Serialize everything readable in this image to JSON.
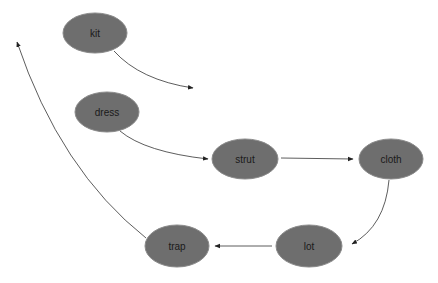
{
  "diagram": {
    "type": "directed-graph",
    "node_color": "#6e6e6e",
    "edge_color": "#333333",
    "nodes": [
      {
        "id": "kit",
        "label": "kit",
        "cx": 95,
        "cy": 33
      },
      {
        "id": "dress",
        "label": "dress",
        "cx": 107,
        "cy": 112
      },
      {
        "id": "strut",
        "label": "strut",
        "cx": 245,
        "cy": 159
      },
      {
        "id": "cloth",
        "label": "cloth",
        "cx": 391,
        "cy": 159
      },
      {
        "id": "lot",
        "label": "lot",
        "cx": 309,
        "cy": 246
      },
      {
        "id": "trap",
        "label": "trap",
        "cx": 177,
        "cy": 246
      }
    ],
    "edges": [
      {
        "from": "kit",
        "to": null
      },
      {
        "from": "dress",
        "to": "strut"
      },
      {
        "from": "strut",
        "to": "cloth"
      },
      {
        "from": "cloth",
        "to": "lot"
      },
      {
        "from": "lot",
        "to": "trap"
      },
      {
        "from": "trap",
        "to": null
      }
    ]
  }
}
